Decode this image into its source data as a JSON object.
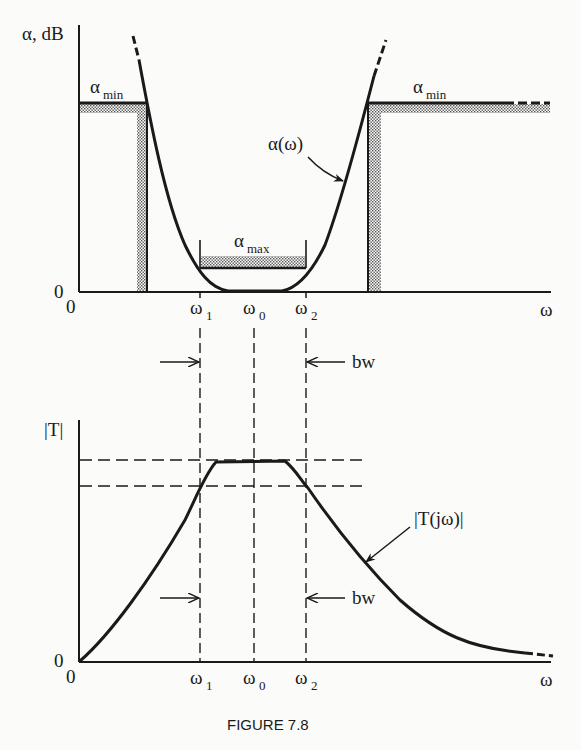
{
  "figure": {
    "caption": "FIGURE 7.8"
  },
  "top_plot": {
    "y_axis_label": "α, dB",
    "x_axis_label": "ω",
    "origin_x": "0",
    "origin_y": "0",
    "alpha_min_left": {
      "main": "α",
      "sub": "min"
    },
    "alpha_min_right": {
      "main": "α",
      "sub": "min"
    },
    "alpha_max": {
      "main": "α",
      "sub": "max"
    },
    "curve_label": "α(ω)",
    "ticks": [
      {
        "main": "ω",
        "sub": "1"
      },
      {
        "main": "ω",
        "sub": "0"
      },
      {
        "main": "ω",
        "sub": "2"
      }
    ]
  },
  "bandwidth_markers": {
    "upper_label": "bw",
    "lower_label": "bw"
  },
  "bottom_plot": {
    "y_axis_label": "|T|",
    "x_axis_label": "ω",
    "origin_x": "0",
    "origin_y": "0",
    "curve_label": "|T(jω)|",
    "ticks": [
      {
        "main": "ω",
        "sub": "1"
      },
      {
        "main": "ω",
        "sub": "0"
      },
      {
        "main": "ω",
        "sub": "2"
      }
    ]
  },
  "colors": {
    "ink": "#1a1a1a",
    "stipple": "#8a8a8a",
    "paper": "#fbfbfa"
  }
}
